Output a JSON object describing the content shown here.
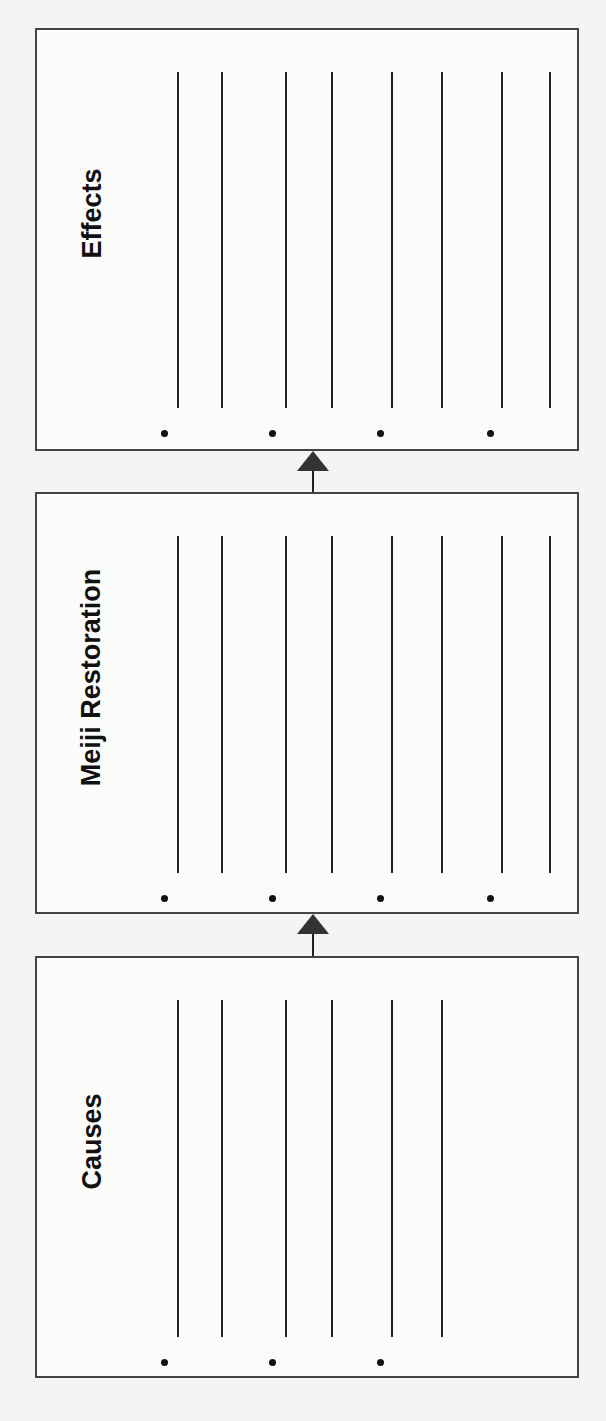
{
  "diagram": {
    "type": "cause-effect flow chart (graphic organizer)",
    "boxes": [
      {
        "id": "effects",
        "title": "Effects",
        "top": 28,
        "height": 423,
        "line_top": 72,
        "line_bottom": 408,
        "bullet_count": 4,
        "line_count": 8
      },
      {
        "id": "meiji",
        "title": "Meiji Restoration",
        "top": 492,
        "height": 422,
        "line_top": 536,
        "line_bottom": 873,
        "bullet_count": 4,
        "line_count": 8
      },
      {
        "id": "causes",
        "title": "Causes",
        "top": 956,
        "height": 422,
        "line_top": 1000,
        "line_bottom": 1337,
        "bullet_count": 3,
        "line_count": 6
      }
    ],
    "arrows": [
      {
        "from": "meiji",
        "to": "effects",
        "top": 451,
        "height": 41
      },
      {
        "from": "causes",
        "to": "meiji",
        "top": 914,
        "height": 42
      }
    ],
    "line_x": [
      177,
      221,
      285,
      331,
      391,
      441,
      501,
      549
    ],
    "bullet_x": [
      164,
      272,
      380,
      490
    ],
    "colors": {
      "line": "#222222",
      "border": "#444444",
      "background": "#f4f4f2"
    }
  }
}
